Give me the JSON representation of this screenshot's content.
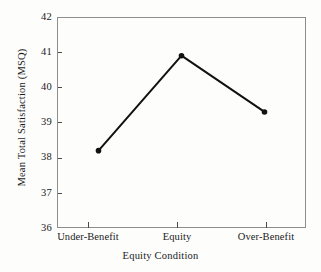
{
  "figure": {
    "background_color": "#fdfdfc",
    "frame_color": "#8d8d8d",
    "line_color": "#111111",
    "marker_color": "#111111"
  },
  "chart_data": {
    "type": "line",
    "title": "",
    "subtitle": "",
    "xlabel": "Equity Condition",
    "ylabel": "Mean Total Satisfaction (MSQ)",
    "categories": [
      "Under-Benefit",
      "Equity",
      "Over-Benefit"
    ],
    "values": [
      38.2,
      40.9,
      39.3
    ],
    "series": [
      {
        "name": "Mean Total Satisfaction (MSQ)",
        "values": [
          38.2,
          40.9,
          39.3
        ]
      }
    ],
    "ylim": [
      36,
      42
    ],
    "yticks": [
      36,
      37,
      38,
      39,
      40,
      41,
      42
    ],
    "ytick_labels": [
      "36",
      "37",
      "38",
      "39",
      "40",
      "41",
      "42"
    ],
    "xtick_labels": [
      "Under-Benefit",
      "Equity",
      "Over-Benefit"
    ],
    "grid": false,
    "legend": false,
    "legend_position": "none",
    "marker": "circle",
    "annotations": []
  }
}
